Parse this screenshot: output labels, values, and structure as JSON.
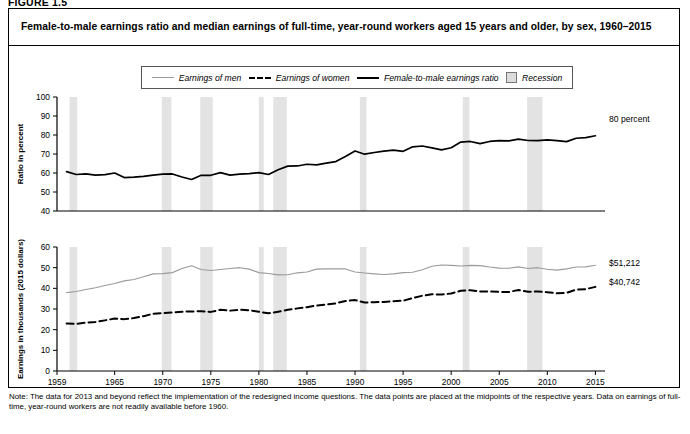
{
  "figure": {
    "label": "FIGURE 1.5",
    "title": "Female-to-male earnings ratio and median earnings of full-time, year-round workers aged 15 years and older, by sex, 1960–2015",
    "note": "Note: The data for 2013 and beyond reflect the implementation of the redesigned income questions. The data points are placed at the midpoints of the respective years. Data on earnings of full-time, year-round workers are not readily available before 1960."
  },
  "legend": {
    "position": "top-center",
    "items": [
      {
        "label": "Earnings of men",
        "style": "solid-thin",
        "color": "#9b9b9b",
        "icon": "line-swatch-icon"
      },
      {
        "label": "Earnings of women",
        "style": "dashed",
        "color": "#000000",
        "icon": "dashed-line-swatch-icon"
      },
      {
        "label": "Female-to-male earnings ratio",
        "style": "solid-thick",
        "color": "#000000",
        "icon": "line-swatch-icon"
      },
      {
        "label": "Recession",
        "style": "band",
        "color": "#dcdcdc",
        "icon": "square-swatch-icon"
      }
    ]
  },
  "annotations": {
    "ratio_end": "80 percent",
    "men_end": "$51,212",
    "women_end": "$40,742"
  },
  "chart_data": {
    "type": "line",
    "title": "Female-to-male earnings ratio and median earnings of full-time, year-round workers aged 15 years and older, by sex, 1960–2015",
    "xlabel": "",
    "xlim": [
      1959,
      2016
    ],
    "xticks": [
      1959,
      1965,
      1970,
      1975,
      1980,
      1985,
      1990,
      1995,
      2000,
      2005,
      2010,
      2015
    ],
    "grid": false,
    "panels": [
      {
        "name": "ratio-panel",
        "ylabel": "Ratio in percent",
        "ylim": [
          40,
          100
        ],
        "yticks": [
          40,
          50,
          60,
          70,
          80,
          90,
          100
        ],
        "series": [
          {
            "name": "Female-to-male earnings ratio",
            "color": "#000000",
            "style": "solid-thick",
            "x": [
              1960,
              1961,
              1962,
              1963,
              1964,
              1965,
              1966,
              1967,
              1968,
              1969,
              1970,
              1971,
              1972,
              1973,
              1974,
              1975,
              1976,
              1977,
              1978,
              1979,
              1980,
              1981,
              1982,
              1983,
              1984,
              1985,
              1986,
              1987,
              1988,
              1989,
              1990,
              1991,
              1992,
              1993,
              1994,
              1995,
              1996,
              1997,
              1998,
              1999,
              2000,
              2001,
              2002,
              2003,
              2004,
              2005,
              2006,
              2007,
              2008,
              2009,
              2010,
              2011,
              2012,
              2013,
              2014,
              2015
            ],
            "values": [
              60.7,
              59.2,
              59.5,
              58.9,
              59.1,
              60.0,
              57.6,
              57.8,
              58.2,
              58.9,
              59.4,
              59.5,
              57.9,
              56.6,
              58.8,
              58.8,
              60.2,
              58.9,
              59.4,
              59.7,
              60.2,
              59.2,
              61.7,
              63.6,
              63.7,
              64.6,
              64.3,
              65.2,
              66.0,
              68.7,
              71.6,
              69.9,
              70.8,
              71.5,
              72.0,
              71.4,
              73.8,
              74.2,
              73.2,
              72.2,
              73.3,
              76.3,
              76.6,
              75.5,
              76.6,
              77.0,
              76.9,
              77.8,
              77.1,
              77.0,
              77.4,
              77.0,
              76.5,
              78.3,
              78.6,
              79.6
            ]
          }
        ]
      },
      {
        "name": "earnings-panel",
        "ylabel": "Earnings in thousands (2015 dollars)",
        "ylim": [
          0,
          60
        ],
        "yticks": [
          0,
          10,
          20,
          30,
          40,
          50,
          60
        ],
        "series": [
          {
            "name": "Earnings of men",
            "color": "#9b9b9b",
            "style": "solid-thin",
            "x": [
              1960,
              1961,
              1962,
              1963,
              1964,
              1965,
              1966,
              1967,
              1968,
              1969,
              1970,
              1971,
              1972,
              1973,
              1974,
              1975,
              1976,
              1977,
              1978,
              1979,
              1980,
              1981,
              1982,
              1983,
              1984,
              1985,
              1986,
              1987,
              1988,
              1989,
              1990,
              1991,
              1992,
              1993,
              1994,
              1995,
              1996,
              1997,
              1998,
              1999,
              2000,
              2001,
              2002,
              2003,
              2004,
              2005,
              2006,
              2007,
              2008,
              2009,
              2010,
              2011,
              2012,
              2013,
              2014,
              2015
            ],
            "values": [
              37.9,
              38.5,
              39.4,
              40.3,
              41.4,
              42.3,
              43.6,
              44.3,
              45.6,
              47.0,
              47.1,
              47.6,
              49.6,
              50.9,
              49.1,
              48.6,
              49.1,
              49.6,
              50.0,
              49.3,
              47.6,
              47.2,
              46.5,
              46.6,
              47.5,
              47.9,
              49.3,
              49.4,
              49.5,
              49.4,
              47.9,
              47.4,
              47.0,
              46.7,
              47.0,
              47.6,
              47.8,
              49.0,
              50.7,
              51.3,
              51.1,
              50.8,
              51.1,
              51.0,
              50.3,
              49.8,
              49.7,
              50.4,
              49.6,
              50.0,
              49.2,
              48.8,
              49.4,
              50.3,
              50.4,
              51.2
            ]
          },
          {
            "name": "Earnings of women",
            "color": "#000000",
            "style": "dashed",
            "x": [
              1960,
              1961,
              1962,
              1963,
              1964,
              1965,
              1966,
              1967,
              1968,
              1969,
              1970,
              1971,
              1972,
              1973,
              1974,
              1975,
              1976,
              1977,
              1978,
              1979,
              1980,
              1981,
              1982,
              1983,
              1984,
              1985,
              1986,
              1987,
              1988,
              1989,
              1990,
              1991,
              1992,
              1993,
              1994,
              1995,
              1996,
              1997,
              1998,
              1999,
              2000,
              2001,
              2002,
              2003,
              2004,
              2005,
              2006,
              2007,
              2008,
              2009,
              2010,
              2011,
              2012,
              2013,
              2014,
              2015
            ],
            "values": [
              23.0,
              22.8,
              23.4,
              23.7,
              24.5,
              25.4,
              25.1,
              25.6,
              26.5,
              27.7,
              28.0,
              28.3,
              28.7,
              28.8,
              28.9,
              28.6,
              29.6,
              29.2,
              29.7,
              29.4,
              28.7,
              27.9,
              28.7,
              29.6,
              30.3,
              30.9,
              31.7,
              32.2,
              32.7,
              33.9,
              34.3,
              33.1,
              33.3,
              33.4,
              33.8,
              34.0,
              35.3,
              36.4,
              37.1,
              37.0,
              37.5,
              38.8,
              39.1,
              38.5,
              38.5,
              38.3,
              38.2,
              39.2,
              38.3,
              38.5,
              38.1,
              37.6,
              37.8,
              39.4,
              39.6,
              40.7
            ]
          }
        ]
      }
    ],
    "recessions": [
      {
        "start": 1960.3,
        "end": 1961.1
      },
      {
        "start": 1969.9,
        "end": 1970.9
      },
      {
        "start": 1973.9,
        "end": 1975.2
      },
      {
        "start": 1980.0,
        "end": 1980.5
      },
      {
        "start": 1981.5,
        "end": 1982.9
      },
      {
        "start": 1990.5,
        "end": 1991.2
      },
      {
        "start": 2001.2,
        "end": 2001.9
      },
      {
        "start": 2007.9,
        "end": 2009.5
      }
    ]
  }
}
